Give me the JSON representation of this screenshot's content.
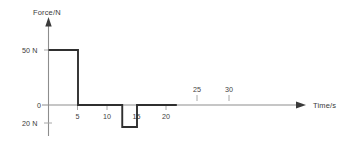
{
  "chart_data": {
    "type": "line",
    "title": "",
    "xlabel": "Time/s",
    "ylabel": "Force/N",
    "xlim": [
      0,
      43.5
    ],
    "ylim": [
      -27,
      64
    ],
    "grid": false,
    "legend": false,
    "step_style": "post",
    "x": [
      0,
      10,
      10,
      25,
      25,
      30,
      30,
      43.5
    ],
    "y": [
      50,
      50,
      0,
      0,
      -20,
      -20,
      0,
      0
    ],
    "segments": [
      {
        "from_t": 0,
        "to_t": 10,
        "force": 50
      },
      {
        "from_t": 10,
        "to_t": 25,
        "force": 0
      },
      {
        "from_t": 25,
        "to_t": 30,
        "force": -20
      },
      {
        "from_t": 30,
        "to_t": 43.5,
        "force": 0
      }
    ],
    "x_ticks_below": [
      {
        "value": 5,
        "label": "5"
      },
      {
        "value": 10,
        "label": "10"
      },
      {
        "value": 15,
        "label": "15"
      },
      {
        "value": 20,
        "label": "20"
      }
    ],
    "x_ticks_above": [
      {
        "value": 25,
        "label": "25"
      },
      {
        "value": 30,
        "label": "30"
      }
    ],
    "y_ticks": [
      {
        "value": 50,
        "label": "50 N"
      },
      {
        "value": 0,
        "label": "0"
      },
      {
        "value": -20,
        "label": "20 N"
      }
    ],
    "colors": {
      "data_line": "#2f2f2f",
      "axis": "#8d8d8d",
      "tick": "#a8a8a8",
      "text": "#3a3a3a",
      "background": "#ffffff"
    }
  },
  "axes": {
    "y_axis_title": "Force/N",
    "x_axis_title": "Time/s"
  },
  "labels": {
    "y_50": "50 N",
    "y_0": "0",
    "y_neg20": "20 N",
    "x_5": "5",
    "x_10": "10",
    "x_15": "15",
    "x_20": "20",
    "x_25": "25",
    "x_30": "30"
  }
}
